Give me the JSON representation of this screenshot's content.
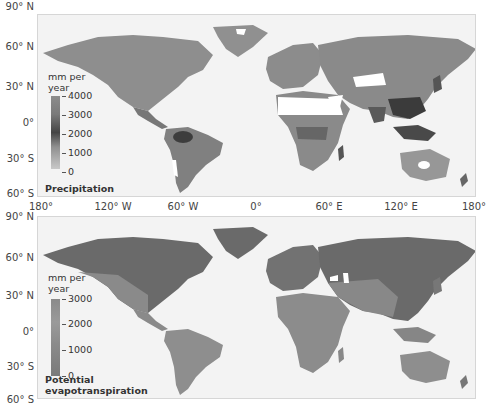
{
  "latitude_labels": [
    "90° N",
    "60° N",
    "30° N",
    "0°",
    "30° S",
    "60° S"
  ],
  "longitude_labels": [
    "180°",
    "120° W",
    "60° W",
    "0°",
    "60° E",
    "120° E",
    "180°"
  ],
  "panels": [
    {
      "title": "Precipitation",
      "legend": {
        "unit_line1": "mm per",
        "unit_line2": "year",
        "ticks": [
          "4000",
          "3000",
          "2000",
          "1000",
          "0"
        ]
      }
    },
    {
      "title_line1": "Potential",
      "title_line2": "evapotranspiration",
      "legend": {
        "unit_line1": "mm per",
        "unit_line2": "year",
        "ticks": [
          "3000",
          "2000",
          "1000",
          "0"
        ]
      }
    }
  ],
  "colors": {
    "ocean": "#f3f3f3",
    "land_mid": "#8a8a8a",
    "land_dark": "#555555",
    "land_light": "#a8a8a8",
    "desert": "#ffffff"
  }
}
